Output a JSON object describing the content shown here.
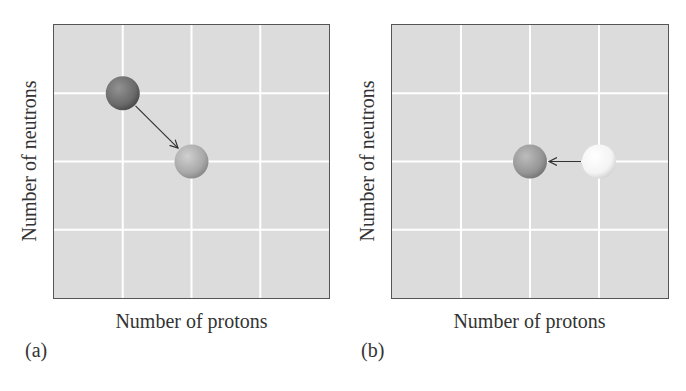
{
  "panels": [
    {
      "id": "a",
      "label": "(a)",
      "xlabel": "Number of protons",
      "ylabel": "Number of neutrons",
      "grid_divisions": 4,
      "nuclei": [
        {
          "role": "parent",
          "grid": [
            1,
            3
          ],
          "shade": "dark",
          "color": "#6a6a6a"
        },
        {
          "role": "daughter",
          "grid": [
            2,
            2
          ],
          "shade": "medium",
          "color": "#a8a8a8"
        }
      ],
      "arrow": {
        "from": 0,
        "to": 1
      }
    },
    {
      "id": "b",
      "label": "(b)",
      "xlabel": "Number of protons",
      "ylabel": "Number of neutrons",
      "grid_divisions": 4,
      "nuclei": [
        {
          "role": "parent",
          "grid": [
            3,
            2
          ],
          "shade": "light",
          "color": "#f4f4f4"
        },
        {
          "role": "daughter",
          "grid": [
            2,
            2
          ],
          "shade": "medium",
          "color": "#959595"
        }
      ],
      "arrow": {
        "from": 0,
        "to": 1
      }
    }
  ],
  "colors": {
    "background": "#dcdcdc",
    "grid": "#ffffff",
    "border": "#555555",
    "arrow": "#333333"
  }
}
